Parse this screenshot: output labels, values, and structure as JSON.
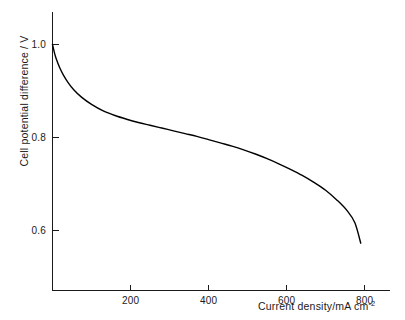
{
  "chart_data": {
    "type": "line",
    "title": "",
    "subtitle": "",
    "xlabel": "Current density/mA cm",
    "xlabel_superscript": "-2",
    "ylabel": "Cell potential difference / V",
    "xlim": [
      0,
      865
    ],
    "ylim": [
      0.47,
      1.07
    ],
    "grid": false,
    "legend": false,
    "xticks": [
      200,
      400,
      600,
      800
    ],
    "xtick_labels": [
      "200",
      "400",
      "600",
      "800"
    ],
    "yticks": [
      0.6,
      0.8,
      1.0
    ],
    "ytick_labels": [
      "0.6",
      "0.8",
      "1.0"
    ],
    "series": [
      {
        "name": "Cell polarization curve",
        "color": "#000000",
        "x": [
          0,
          5,
          10,
          18,
          28,
          40,
          55,
          75,
          100,
          130,
          160,
          190,
          220,
          250,
          280,
          310,
          340,
          370,
          400,
          430,
          460,
          490,
          520,
          550,
          580,
          610,
          640,
          670,
          700,
          730,
          755,
          775,
          790
        ],
        "y": [
          1.0,
          0.982,
          0.968,
          0.951,
          0.934,
          0.918,
          0.902,
          0.886,
          0.871,
          0.857,
          0.847,
          0.839,
          0.832,
          0.826,
          0.82,
          0.814,
          0.808,
          0.802,
          0.795,
          0.788,
          0.781,
          0.773,
          0.764,
          0.754,
          0.743,
          0.731,
          0.718,
          0.703,
          0.686,
          0.664,
          0.642,
          0.616,
          0.572
        ]
      }
    ],
    "annotations": []
  },
  "axes": {
    "y_axis_name": "cell-potential-axis",
    "x_axis_name": "current-density-axis"
  }
}
